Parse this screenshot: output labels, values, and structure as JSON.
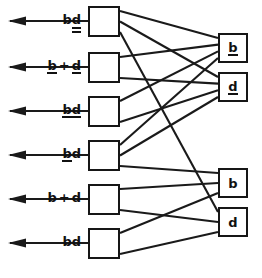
{
  "diagram": {
    "type": "switching-network",
    "width": 262,
    "height": 278,
    "line_color": "#1a1a1a",
    "box_border_color": "#161616",
    "background": "#ffffff",
    "inputs": [
      {
        "id": "in1",
        "label_text": "bd",
        "tokens": [
          {
            "text": "b",
            "notation": "plain"
          },
          {
            "text": "d",
            "notation": "double-underline"
          }
        ],
        "arrow_direction": "left",
        "y": 21
      },
      {
        "id": "in2",
        "label_text": "b + d",
        "tokens": [
          {
            "text": "b",
            "notation": "underline"
          },
          {
            "text": "+",
            "notation": "operator"
          },
          {
            "text": "d",
            "notation": "underline"
          }
        ],
        "arrow_direction": "left",
        "y": 67
      },
      {
        "id": "in3",
        "label_text": "bd",
        "tokens": [
          {
            "text": "b",
            "notation": "underline"
          },
          {
            "text": "d",
            "notation": "underline"
          }
        ],
        "arrow_direction": "left",
        "y": 111
      },
      {
        "id": "in4",
        "label_text": "bd",
        "tokens": [
          {
            "text": "b",
            "notation": "underline"
          },
          {
            "text": "d",
            "notation": "plain"
          }
        ],
        "arrow_direction": "left",
        "y": 155
      },
      {
        "id": "in5",
        "label_text": "b + d",
        "tokens": [
          {
            "text": "b",
            "notation": "plain"
          },
          {
            "text": "+",
            "notation": "operator"
          },
          {
            "text": "d",
            "notation": "plain"
          }
        ],
        "arrow_direction": "left",
        "y": 199
      },
      {
        "id": "in6",
        "label_text": "bd",
        "tokens": [
          {
            "text": "b",
            "notation": "plain"
          },
          {
            "text": "d",
            "notation": "plain"
          }
        ],
        "arrow_direction": "left",
        "y": 243
      }
    ],
    "left_nodes": [
      {
        "id": "L1",
        "x": 88,
        "y": 6
      },
      {
        "id": "L2",
        "x": 88,
        "y": 52
      },
      {
        "id": "L3",
        "x": 88,
        "y": 96
      },
      {
        "id": "L4",
        "x": 88,
        "y": 140
      },
      {
        "id": "L5",
        "x": 88,
        "y": 184
      },
      {
        "id": "L6",
        "x": 88,
        "y": 228
      }
    ],
    "right_nodes": [
      {
        "id": "R1",
        "x": 218,
        "y": 33,
        "label_text": "b",
        "tokens": [
          {
            "text": "b",
            "notation": "underline"
          }
        ]
      },
      {
        "id": "R2",
        "x": 218,
        "y": 72,
        "label_text": "d",
        "tokens": [
          {
            "text": "d",
            "notation": "underline"
          }
        ]
      },
      {
        "id": "R3",
        "x": 218,
        "y": 168,
        "label_text": "b",
        "tokens": [
          {
            "text": "b",
            "notation": "plain"
          }
        ]
      },
      {
        "id": "R4",
        "x": 218,
        "y": 207,
        "label_text": "d",
        "tokens": [
          {
            "text": "d",
            "notation": "plain"
          }
        ]
      }
    ],
    "edges": [
      {
        "from": "L1",
        "to": "R1"
      },
      {
        "from": "L1",
        "to": "R2"
      },
      {
        "from": "L1",
        "to": "R4"
      },
      {
        "from": "L2",
        "to": "R1"
      },
      {
        "from": "L2",
        "to": "R2"
      },
      {
        "from": "L3",
        "to": "R1"
      },
      {
        "from": "L3",
        "to": "R2"
      },
      {
        "from": "L4",
        "to": "R1"
      },
      {
        "from": "L4",
        "to": "R2"
      },
      {
        "from": "L4",
        "to": "R3"
      },
      {
        "from": "L5",
        "to": "R3"
      },
      {
        "from": "L5",
        "to": "R4"
      },
      {
        "from": "L6",
        "to": "R3"
      },
      {
        "from": "L6",
        "to": "R4"
      }
    ]
  }
}
